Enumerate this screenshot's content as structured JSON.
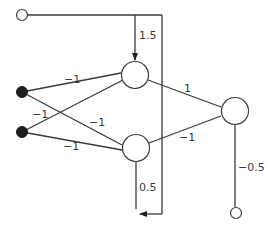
{
  "diagram": {
    "type": "neural-network",
    "nodes": {
      "bias_top": {
        "kind": "open-input"
      },
      "input_1": {
        "kind": "filled-input"
      },
      "input_2": {
        "kind": "filled-input"
      },
      "hidden_top": {
        "kind": "neuron"
      },
      "hidden_bottom": {
        "kind": "neuron"
      },
      "output": {
        "kind": "neuron"
      },
      "bias_output": {
        "kind": "open-input"
      }
    },
    "weights": {
      "bias_to_hidden_top": "1.5",
      "bias_to_hidden_bottom": "0.5",
      "input1_to_hidden_top": "−1",
      "input1_to_hidden_bottom": "−1",
      "input2_to_hidden_top": "−1",
      "input2_to_hidden_bottom": "−1",
      "hidden_top_to_output": "1",
      "hidden_bottom_to_output": "−1",
      "bias_to_output": "−0.5"
    }
  }
}
